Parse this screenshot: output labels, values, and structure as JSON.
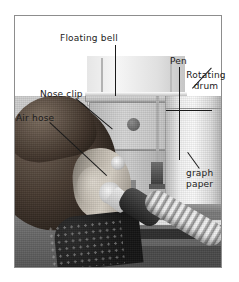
{
  "figure": {
    "type": "labeled-photograph",
    "border_color": "#8d8d8d",
    "background_color": "#ffffff",
    "text_color": "#1b1b1b"
  },
  "labels": {
    "floating_bell": "Floating bell",
    "pen": "Pen",
    "rotating_drum_line1": "Rotating",
    "rotating_drum_line2": "drum",
    "nose_clip": "Nose clip",
    "air_hose": "Air hose",
    "graph_line1": "graph",
    "graph_line2": "paper"
  }
}
